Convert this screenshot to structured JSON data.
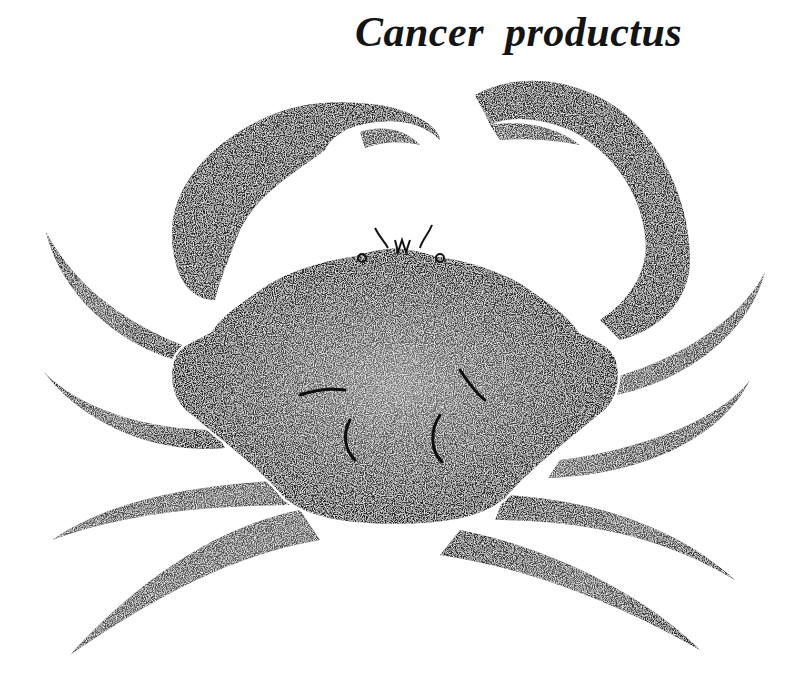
{
  "illustration": {
    "title": "Cancer productus",
    "subject": "crab-illustration",
    "style": "stipple ink drawing, black on white",
    "colors": {
      "ink": "#141414",
      "background": "#ffffff",
      "carapace_outline": "#ffffff"
    }
  }
}
